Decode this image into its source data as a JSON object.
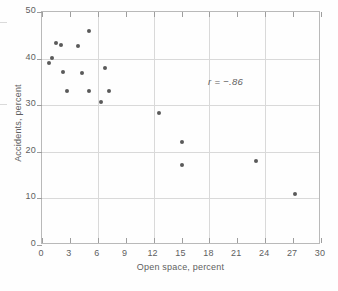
{
  "chart_data": {
    "type": "scatter",
    "title": "",
    "xlabel": "Open space, percent",
    "ylabel": "Accidents, percent",
    "xlim": [
      0,
      30
    ],
    "ylim": [
      0,
      50
    ],
    "xticks": [
      0,
      3,
      6,
      9,
      12,
      15,
      18,
      21,
      24,
      27,
      30
    ],
    "yticks": [
      0,
      10,
      20,
      30,
      40,
      50
    ],
    "xtick_labels": [
      "0",
      "3",
      "6",
      "9",
      "12",
      "15",
      "18",
      "21",
      "24",
      "27",
      "30"
    ],
    "ytick_labels": [
      "0",
      "10",
      "20",
      "30",
      "40",
      "50"
    ],
    "grid": true,
    "grid_x_values": [
      6,
      12,
      18,
      24
    ],
    "grid_y_values": [
      10,
      20,
      30,
      40
    ],
    "legend": null,
    "annotations": [
      {
        "text": "r = −.86",
        "x": 19.5,
        "y": 33.5,
        "style": "italic"
      }
    ],
    "marker_color": "#5a5a5a",
    "marker_size": 4,
    "points": [
      {
        "x": 0.8,
        "y": 39.0
      },
      {
        "x": 1.1,
        "y": 40.2
      },
      {
        "x": 1.5,
        "y": 43.3
      },
      {
        "x": 2.0,
        "y": 43.0
      },
      {
        "x": 2.3,
        "y": 37.2
      },
      {
        "x": 2.7,
        "y": 33.0
      },
      {
        "x": 3.9,
        "y": 42.7
      },
      {
        "x": 4.3,
        "y": 37.0
      },
      {
        "x": 5.0,
        "y": 46.0
      },
      {
        "x": 5.0,
        "y": 33.0
      },
      {
        "x": 6.3,
        "y": 30.7
      },
      {
        "x": 6.8,
        "y": 38.0
      },
      {
        "x": 7.2,
        "y": 33.0
      },
      {
        "x": 12.6,
        "y": 28.3
      },
      {
        "x": 15.0,
        "y": 22.0
      },
      {
        "x": 15.0,
        "y": 17.2
      },
      {
        "x": 23.0,
        "y": 18.0
      },
      {
        "x": 27.2,
        "y": 11.0
      }
    ]
  }
}
